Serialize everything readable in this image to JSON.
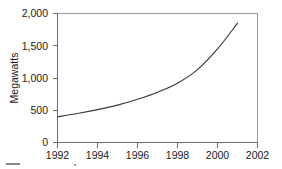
{
  "figure": {
    "background_color": "#ffffff",
    "line_color": "#3a3a3a",
    "axis_color": "#6d6d6d",
    "frame_color": "#9a9a9a",
    "text_color": "#1b1b1b"
  },
  "chart_data": {
    "type": "line",
    "title": "",
    "subtitle": "",
    "xlabel": "",
    "ylabel": "Megawatts",
    "xlim": [
      1992,
      2002
    ],
    "ylim": [
      0,
      2000
    ],
    "grid": false,
    "legend": null,
    "x_ticks": [
      1992,
      1994,
      1996,
      1998,
      2000,
      2002
    ],
    "x_tick_labels": [
      "1992",
      "1994",
      "1996",
      "1998",
      "2000",
      "2002"
    ],
    "y_ticks": [
      0,
      500,
      1000,
      1500,
      2000
    ],
    "y_tick_labels": [
      "0",
      "500",
      "1,000",
      "1,500",
      "2,000"
    ],
    "series": [
      {
        "name": "Installed capacity",
        "x": [
          1992,
          1993,
          1994,
          1995,
          1996,
          1997,
          1998,
          1999,
          2000,
          2001
        ],
        "values": [
          400,
          450,
          510,
          580,
          670,
          780,
          920,
          1130,
          1450,
          1850
        ]
      }
    ],
    "annotations": []
  },
  "caption": {
    "text": ""
  }
}
